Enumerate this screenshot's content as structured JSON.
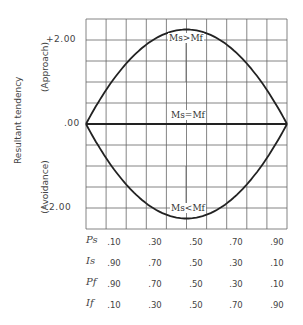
{
  "chart_data": {
    "type": "line",
    "title": "",
    "ylabel": "Resultant tendency",
    "ylabel_positive": "(Approach)",
    "ylabel_negative": "(Avoidance)",
    "xlabel": "",
    "y_ticks": [
      "+2.00",
      ".00",
      "- 2.00"
    ],
    "y_tick_values": [
      2.0,
      0.0,
      -2.0
    ],
    "ylim": [
      -2.5,
      2.5
    ],
    "grid": true,
    "x": [
      0.0,
      0.1,
      0.2,
      0.3,
      0.4,
      0.5,
      0.6,
      0.7,
      0.8,
      0.9,
      1.0
    ],
    "series": [
      {
        "name": "Ms > Mf",
        "label": "Ms>Mf",
        "values": [
          0.0,
          0.81,
          1.44,
          1.89,
          2.16,
          2.25,
          2.16,
          1.89,
          1.44,
          0.81,
          0.0
        ]
      },
      {
        "name": "Ms = Mf",
        "label": "Ms=Mf",
        "values": [
          0.0,
          0.0,
          0.0,
          0.0,
          0.0,
          0.0,
          0.0,
          0.0,
          0.0,
          0.0,
          0.0
        ]
      },
      {
        "name": "Ms < Mf",
        "label": "Ms<Mf",
        "values": [
          0.0,
          -0.81,
          -1.44,
          -1.89,
          -2.16,
          -2.25,
          -2.16,
          -1.89,
          -1.44,
          -0.81,
          0.0
        ]
      }
    ],
    "x_table": {
      "rows": [
        {
          "label": "Ps",
          "values": [
            ".10",
            ".30",
            ".50",
            ".70",
            ".90"
          ]
        },
        {
          "label": "Is",
          "values": [
            ".90",
            ".70",
            ".50",
            ".30",
            ".10"
          ]
        },
        {
          "label": "Pf",
          "values": [
            ".90",
            ".70",
            ".50",
            ".30",
            ".10"
          ]
        },
        {
          "label": "If",
          "values": [
            ".10",
            ".30",
            ".50",
            ".70",
            ".90"
          ]
        }
      ]
    },
    "legend_position": "inline"
  }
}
